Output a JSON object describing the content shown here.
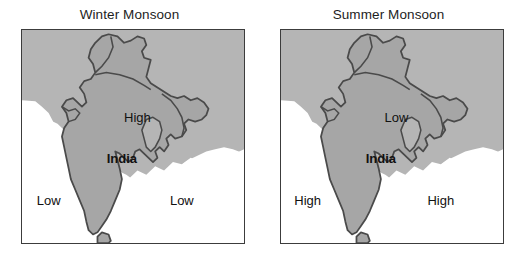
{
  "figure": {
    "background_color": "#ffffff",
    "panel_count": 2
  },
  "colors": {
    "india_fill": "#a6a6a6",
    "neighbor_fill": "#b5b5b5",
    "sea_fill": "#ffffff",
    "border_stroke": "#4a4a4a",
    "frame_stroke": "#3c3c3c",
    "label_text": "#111111",
    "title_text": "#1d1d1d"
  },
  "panels": [
    {
      "id": "winter",
      "title": "Winter Monsoon",
      "country_label": "India",
      "labels": [
        {
          "name": "pressure-label-north",
          "text": "High",
          "x": 52,
          "y": 41
        },
        {
          "name": "pressure-label-country",
          "text": "India",
          "x": 45,
          "y": 60
        },
        {
          "name": "pressure-label-southwest",
          "text": "Low",
          "x": 12,
          "y": 80
        },
        {
          "name": "pressure-label-southeast",
          "text": "Low",
          "x": 72,
          "y": 80
        }
      ]
    },
    {
      "id": "summer",
      "title": "Summer Monsoon",
      "country_label": "India",
      "labels": [
        {
          "name": "pressure-label-north",
          "text": "Low",
          "x": 52,
          "y": 41
        },
        {
          "name": "pressure-label-country",
          "text": "India",
          "x": 45,
          "y": 60
        },
        {
          "name": "pressure-label-southwest",
          "text": "High",
          "x": 12,
          "y": 80
        },
        {
          "name": "pressure-label-southeast",
          "text": "High",
          "x": 72,
          "y": 80
        }
      ]
    }
  ],
  "map": {
    "subject": "india-map",
    "features": [
      "india-landmass",
      "neighbouring-countries",
      "sri-lanka",
      "bay-of-bengal",
      "arabian-sea"
    ]
  }
}
